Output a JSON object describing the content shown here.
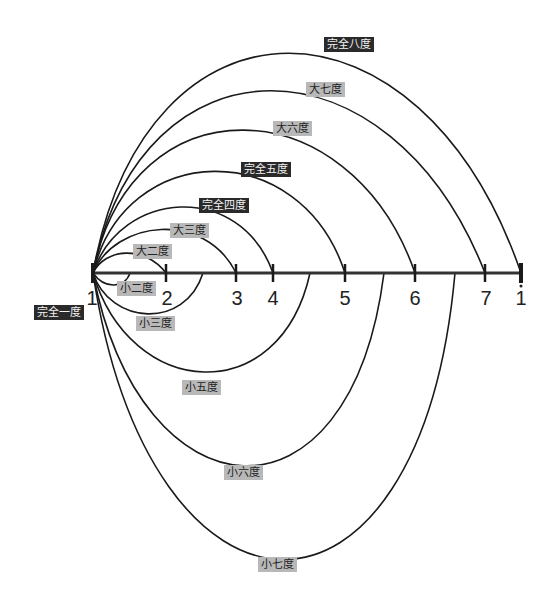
{
  "diagram": {
    "title": "",
    "axis": {
      "notes": [
        "1",
        "2",
        "3",
        "4",
        "5",
        "6",
        "7",
        "1"
      ],
      "last_note_octave_dot": true,
      "tick_x": [
        93,
        166,
        236,
        273,
        345,
        415,
        485,
        521
      ]
    },
    "upper_intervals": [
      {
        "label": "大二度",
        "style": "light"
      },
      {
        "label": "大三度",
        "style": "light"
      },
      {
        "label": "完全四度",
        "style": "dark"
      },
      {
        "label": "完全五度",
        "style": "dark"
      },
      {
        "label": "大六度",
        "style": "light"
      },
      {
        "label": "大七度",
        "style": "light"
      },
      {
        "label": "完全八度",
        "style": "dark"
      }
    ],
    "lower_intervals": [
      {
        "label": "小二度",
        "style": "light"
      },
      {
        "label": "小三度",
        "style": "light"
      },
      {
        "label": "小五度",
        "style": "light"
      },
      {
        "label": "小六度",
        "style": "light"
      },
      {
        "label": "小七度",
        "style": "light"
      }
    ],
    "unison": {
      "label": "完全一度",
      "style": "dark"
    },
    "colors": {
      "dark_label_bg": "#2a2a2a",
      "light_label_bg": "#b8b8b8",
      "line": "#1a1a1a"
    }
  }
}
